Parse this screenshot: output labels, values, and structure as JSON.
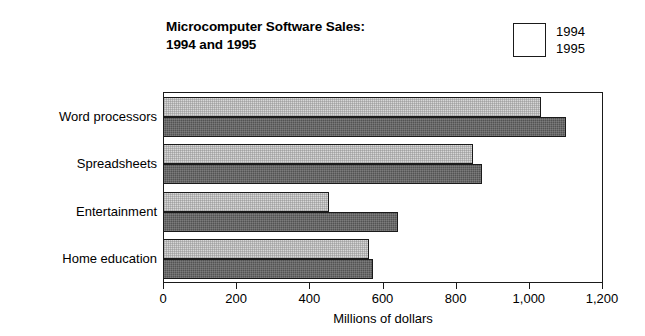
{
  "chart_data": {
    "type": "bar",
    "orientation": "horizontal",
    "title": "Microcomputer Software Sales:\n1994 and 1995",
    "title_lines": [
      "Microcomputer Software Sales:",
      "1994 and 1995"
    ],
    "xlabel": "Millions of dollars",
    "ylabel": "",
    "xlim": [
      0,
      1200
    ],
    "xticks": [
      0,
      200,
      400,
      600,
      800,
      1000,
      1200
    ],
    "xtick_labels": [
      "0",
      "200",
      "400",
      "600",
      "800",
      "1,000",
      "1,200"
    ],
    "grid": false,
    "legend_position": "top-right",
    "categories": [
      "Word processors",
      "Spreadsheets",
      "Entertainment",
      "Home education"
    ],
    "series": [
      {
        "name": "1994",
        "color": "#d7d7d7",
        "values": [
          1030,
          845,
          450,
          560
        ]
      },
      {
        "name": "1995",
        "color": "#535353",
        "values": [
          1100,
          870,
          640,
          570
        ]
      }
    ]
  },
  "legend": {
    "items": [
      {
        "label": "1994",
        "swatch": "light-gray-swatch"
      },
      {
        "label": "1995",
        "swatch": "dark-gray-swatch"
      }
    ]
  },
  "colors": {
    "series_1994": "#d7d7d7",
    "series_1995": "#535353",
    "axis": "#1a1a1a",
    "background": "#ffffff",
    "text": "#000000"
  }
}
